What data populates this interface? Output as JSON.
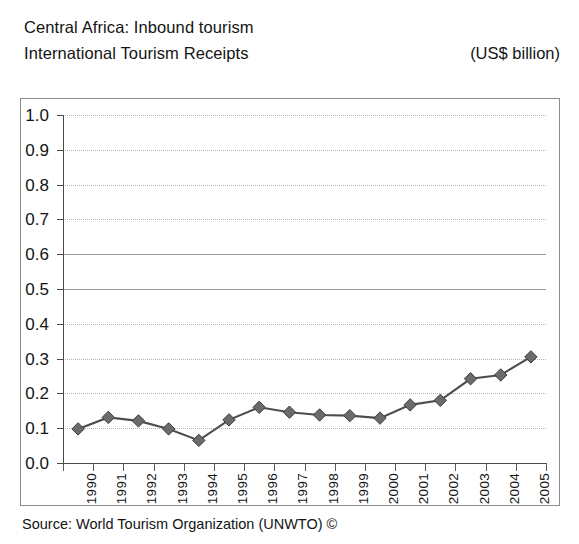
{
  "header": {
    "title_line_1": "Central Africa: Inbound tourism",
    "title_line_2": "International Tourism Receipts",
    "units": "(US$ billion)"
  },
  "footer": {
    "source": "Source: World Tourism Organization (UNWTO) ©"
  },
  "style": {
    "frame_color": "#8c8c8c",
    "axis_color": "#4a4a4a",
    "grid_color": "#b4b4b4",
    "marker_color": "#6b6b6b",
    "line_color": "#4d4d4d"
  },
  "chart_data": {
    "type": "line",
    "subtitle": "International Tourism Receipts",
    "xlabel": "",
    "ylabel": "(US$ billion)",
    "ylim": [
      0.0,
      1.0
    ],
    "ytick_step": 0.1,
    "ytick_labels": [
      "1.0",
      "0.9",
      "0.8",
      "0.7",
      "0.6",
      "0.5",
      "0.4",
      "0.3",
      "0.2",
      "0.1",
      "0.0"
    ],
    "grid": true,
    "grid_axis": "y",
    "legend": false,
    "marker": "diamond",
    "categories": [
      "1990",
      "1991",
      "1992",
      "1993",
      "1994",
      "1995",
      "1996",
      "1997",
      "1998",
      "1999",
      "2000",
      "2001",
      "2002",
      "2003",
      "2004",
      "2005"
    ],
    "values": [
      0.098,
      0.131,
      0.121,
      0.098,
      0.065,
      0.124,
      0.16,
      0.146,
      0.138,
      0.136,
      0.129,
      0.167,
      0.18,
      0.242,
      0.253,
      0.305
    ],
    "series": [
      {
        "name": "International Tourism Receipts",
        "values": [
          0.098,
          0.131,
          0.121,
          0.098,
          0.065,
          0.124,
          0.16,
          0.146,
          0.138,
          0.136,
          0.129,
          0.167,
          0.18,
          0.242,
          0.253,
          0.305
        ]
      }
    ]
  }
}
